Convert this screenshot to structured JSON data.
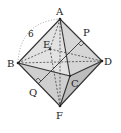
{
  "figure": {
    "type": "octahedron",
    "vertices": {
      "A": {
        "label": "A",
        "x": 60,
        "y": 19
      },
      "B": {
        "label": "B",
        "x": 18,
        "y": 63
      },
      "C": {
        "label": "C",
        "x": 70,
        "y": 76
      },
      "D": {
        "label": "D",
        "x": 102,
        "y": 61
      },
      "E": {
        "label": "E",
        "x": 50,
        "y": 49
      },
      "F": {
        "label": "F",
        "x": 60,
        "y": 106
      }
    },
    "points": {
      "P": {
        "label": "P",
        "x": 82,
        "y": 40
      },
      "Q": {
        "label": "Q",
        "x": 38,
        "y": 84
      }
    },
    "edge_length_label": "6",
    "colors": {
      "face_light": "#e6e6e6",
      "face_mid": "#d2d2d2",
      "face_dark": "#bdbdbd",
      "edge": "#333333",
      "dashed": "#444444",
      "arc": "#999999"
    }
  }
}
